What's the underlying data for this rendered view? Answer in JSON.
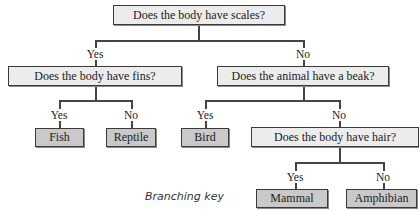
{
  "diagram": {
    "caption": "Branching key",
    "nodes": {
      "scales": "Does the body have scales?",
      "fins": "Does the body have fins?",
      "beak": "Does the animal have a beak?",
      "hair": "Does the body have hair?",
      "fish": "Fish",
      "reptile": "Reptile",
      "bird": "Bird",
      "mammal": "Mammal",
      "amphibian": "Amphibian"
    },
    "edges": {
      "scales_yes": "Yes",
      "scales_no": "No",
      "fins_yes": "Yes",
      "fins_no": "No",
      "beak_yes": "Yes",
      "beak_no": "No",
      "hair_yes": "Yes",
      "hair_no": "No"
    },
    "colors": {
      "question_fill": "#ececec",
      "leaf_fill": "#c9c9c9",
      "line": "#444444"
    }
  }
}
